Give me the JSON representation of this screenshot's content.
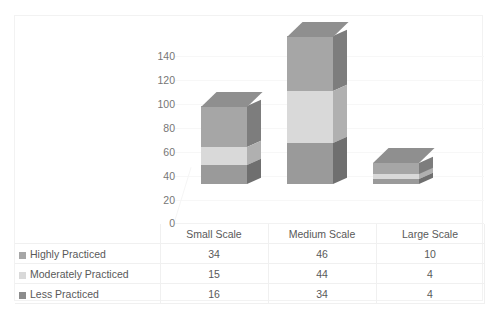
{
  "top_strip_text": "",
  "chart_data": {
    "type": "bar",
    "subtype": "stacked-column-3d",
    "title": "",
    "xlabel": "",
    "ylabel": "",
    "ylim": [
      0,
      140
    ],
    "yticks": [
      140,
      120,
      100,
      80,
      60,
      40,
      20,
      0
    ],
    "grid": true,
    "legend_position": "data-table-left",
    "categories": [
      "Small Scale",
      "Medium Scale",
      "Large Scale"
    ],
    "series": [
      {
        "name": "Highly Practiced",
        "values": [
          34,
          46,
          10
        ],
        "color": "#a6a6a6"
      },
      {
        "name": "Moderately Practiced",
        "values": [
          15,
          44,
          4
        ],
        "color": "#d9d9d9"
      },
      {
        "name": "Less Practiced",
        "values": [
          16,
          34,
          4
        ],
        "color": "#8c8c8c"
      }
    ],
    "totals": [
      65,
      124,
      18
    ],
    "stack_order_bottom_to_top": [
      "Less Practiced",
      "Moderately Practiced",
      "Highly Practiced"
    ]
  },
  "data_table": {
    "column_headers": [
      "",
      "Small Scale",
      "Medium Scale",
      "Large Scale"
    ],
    "rows": [
      {
        "label": "Highly Practiced",
        "swatch": "#a6a6a6",
        "values": [
          "34",
          "46",
          "10"
        ]
      },
      {
        "label": "Moderately Practiced",
        "swatch": "#d9d9d9",
        "values": [
          "15",
          "44",
          "4"
        ]
      },
      {
        "label": "Less Practiced",
        "swatch": "#8c8c8c",
        "values": [
          "16",
          "34",
          "4"
        ]
      }
    ]
  }
}
